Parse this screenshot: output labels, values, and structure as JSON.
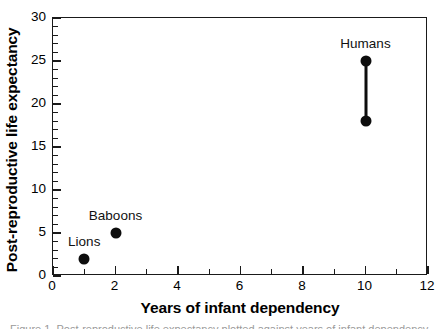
{
  "chart_data": {
    "type": "scatter",
    "title": "",
    "xlabel": "Years of infant dependency",
    "ylabel": "Post-reproductive life expectancy",
    "xlim": [
      0,
      12
    ],
    "ylim": [
      0,
      30
    ],
    "grid": false,
    "legend": "none",
    "x_ticks_major": [
      0,
      2,
      4,
      6,
      8,
      10,
      12
    ],
    "x_ticks_major_labels": [
      "0",
      "2",
      "4",
      "6",
      "8",
      "10",
      "12"
    ],
    "x_ticks_minor": [
      1,
      3,
      5,
      7,
      9,
      11
    ],
    "y_ticks_major": [
      0,
      5,
      10,
      15,
      20,
      25,
      30
    ],
    "y_ticks_major_labels": [
      "0",
      "5",
      "10",
      "15",
      "20",
      "25",
      "30"
    ],
    "y_ticks_minor": [
      1,
      2,
      3,
      4,
      6,
      7,
      8,
      9,
      11,
      12,
      13,
      14,
      16,
      17,
      18,
      19,
      21,
      22,
      23,
      24,
      26,
      27,
      28,
      29
    ],
    "marker_color": "#0d0d0d",
    "points": [
      {
        "label": "Lions",
        "x": 1,
        "y": 2,
        "label_dx": 0,
        "label_dy": -11
      },
      {
        "label": "Baboons",
        "x": 2,
        "y": 5,
        "label_dx": 0,
        "label_dy": -11
      },
      {
        "label": "Humans",
        "x": 10,
        "y": 25,
        "label_dx": 0,
        "label_dy": -11
      },
      {
        "label": "",
        "x": 10,
        "y": 18,
        "label_dx": 0,
        "label_dy": 0
      }
    ],
    "connectors": [
      {
        "x": 10,
        "y0": 18,
        "y1": 25
      }
    ],
    "annotations": [
      "Lions",
      "Baboons",
      "Humans"
    ]
  },
  "caption_sliver": "Figure 1. Post-reproductive life expectancy plotted against years of infant dependency."
}
